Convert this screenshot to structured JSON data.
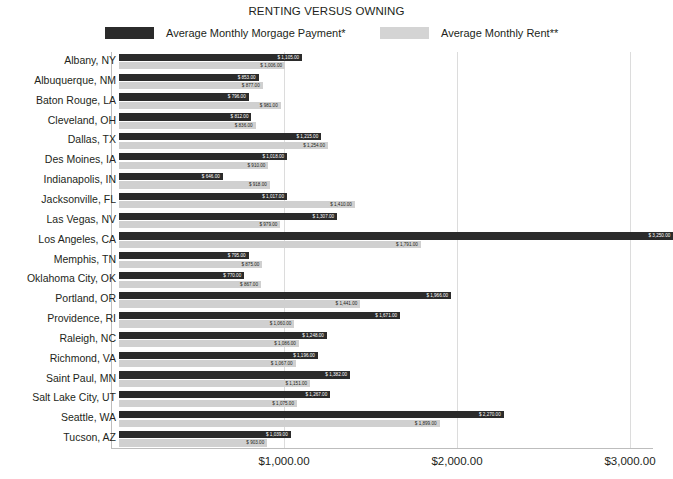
{
  "chart_data": {
    "type": "bar",
    "orientation": "horizontal",
    "title": "RENTING VERSUS OWNING",
    "xlabel": "",
    "ylabel": "",
    "xlim": [
      0,
      3130
    ],
    "grid": true,
    "legend_position": "top",
    "xticks": [
      "$1,000.00",
      "$2,000.00",
      "$3,000.00"
    ],
    "xtick_values": [
      1000,
      2000,
      3000
    ],
    "categories": [
      "Albany, NY",
      "Albuquerque, NM",
      "Baton Rouge, LA",
      "Cleveland, OH",
      "Dallas, TX",
      "Des Moines, IA",
      "Indianapolis, IN",
      "Jacksonville, FL",
      "Las Vegas, NV",
      "Los Angeles, CA",
      "Memphis, TN",
      "Oklahoma City, OK",
      "Portland, OR",
      "Providence, RI",
      "Raleigh, NC",
      "Richmond, VA",
      "Saint Paul, MN",
      "Salt Lake City, UT",
      "Seattle, WA",
      "Tucson, AZ"
    ],
    "series": [
      {
        "name": "Average Monthly Morgage Payment*",
        "color": "#2b2b2b",
        "values": [
          1105,
          853,
          796,
          812,
          1215,
          1018,
          646,
          1017,
          1307,
          3250,
          795,
          770,
          1966,
          1671,
          1248,
          1196,
          1382,
          1267,
          2270,
          1039
        ],
        "labels": [
          "$ 1,105.00",
          "$ 853.00",
          "$ 796.00",
          "$ 812.00",
          "$ 1,215.00",
          "$ 1,018.00",
          "$ 646.00",
          "$ 1,017.00",
          "$ 1,307.00",
          "$ 3,250.00",
          "$ 795.00",
          "$ 770.00",
          "$ 1,966.00",
          "$ 1,671.00",
          "$ 1,248.00",
          "$ 1,196.00",
          "$ 1,382.00",
          "$ 1,267.00",
          "$ 2,270.00",
          "$ 1,039.00"
        ]
      },
      {
        "name": "Average Monthly Rent**",
        "color": "#d0d0d0",
        "values": [
          1006,
          877,
          981,
          836,
          1254,
          910,
          918,
          1410,
          979,
          1791,
          875,
          867,
          1441,
          1060,
          1086,
          1067,
          1151,
          1075,
          1899,
          903
        ],
        "labels": [
          "$ 1,006.00",
          "$ 877.00",
          "$ 981.00",
          "$ 836.00",
          "$ 1,254.00",
          "$ 910.00",
          "$ 918.00",
          "$ 1,410.00",
          "$ 979.00",
          "$ 1,791.00",
          "$ 875.00",
          "$ 867.00",
          "$ 1,441.00",
          "$ 1,060.00",
          "$ 1,086.00",
          "$ 1,067.00",
          "$ 1,151.00",
          "$ 1,075.00",
          "$ 1,899.00",
          "$ 903.00"
        ]
      }
    ]
  },
  "legend": {
    "owning_label": "Average Monthly Morgage Payment*",
    "renting_label": "Average Monthly Rent**",
    "owning_color": "#2b2b2b",
    "renting_color": "#d4d4d4"
  }
}
